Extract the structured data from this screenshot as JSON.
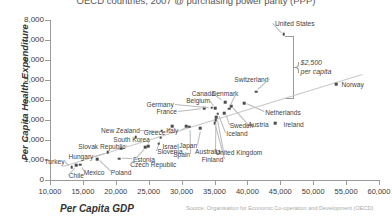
{
  "chart": {
    "title": "OECD countries, 2007 @ purchasing power parity (PPP)",
    "ylabel": "Per Capita Health Expenditure",
    "xlabel": "Per Capita GDP",
    "source": "Source: Organisation for Economic Co-operation and Development (OECD)",
    "annotation_line1": "$2,500",
    "annotation_line2": "per capita"
  },
  "chart_data": {
    "type": "scatter",
    "title": "OECD countries, 2007 @ purchasing power parity (PPP)",
    "xlabel": "Per Capita GDP",
    "ylabel": "Per Capita Health Expenditure",
    "xlim": [
      10000,
      60000
    ],
    "ylim": [
      0,
      8000
    ],
    "xticks": [
      "10,000",
      "15,000",
      "20,000",
      "25,000",
      "30,000",
      "35,000",
      "40,000",
      "45,000",
      "50,000",
      "55,000",
      "60,000"
    ],
    "yticks": [
      "0",
      "1,000",
      "2,000",
      "3,000",
      "4,000",
      "5,000",
      "6,000",
      "7,000",
      "8,000"
    ],
    "grid": false,
    "legend": null,
    "trendline": {
      "x0": 12000,
      "y0": 700,
      "x1": 57500,
      "y1": 5300
    },
    "annotations": [
      {
        "text": "$2,500 per capita",
        "x": 47500,
        "y": 5900,
        "note": "brace spanning United States point down to the trend line"
      }
    ],
    "points": [
      {
        "label": "Turkey",
        "x": 13300,
        "y": 640,
        "lx": 12200,
        "ly": 960,
        "anchor": "end"
      },
      {
        "label": "Chile",
        "x": 14000,
        "y": 740,
        "lx": 14000,
        "ly": 250,
        "anchor": "middle"
      },
      {
        "label": "Mexico",
        "x": 14600,
        "y": 760,
        "lx": 16700,
        "ly": 420,
        "anchor": "middle"
      },
      {
        "label": "Hungary",
        "x": 18800,
        "y": 1390,
        "lx": 16600,
        "ly": 1200,
        "anchor": "end"
      },
      {
        "label": "Poland",
        "x": 17200,
        "y": 1040,
        "lx": 20800,
        "ly": 400,
        "anchor": "middle"
      },
      {
        "label": "Estonia",
        "x": 20500,
        "y": 1070,
        "lx": 22600,
        "ly": 1060,
        "anchor": "start"
      },
      {
        "label": "Slovak Republic",
        "x": 20800,
        "y": 1570,
        "lx": 17900,
        "ly": 1720,
        "anchor": "middle"
      },
      {
        "label": "Czech Republic",
        "x": 24500,
        "y": 1640,
        "lx": 25700,
        "ly": 800,
        "anchor": "middle"
      },
      {
        "label": "South Korea",
        "x": 24900,
        "y": 1680,
        "lx": 22400,
        "ly": 2060,
        "anchor": "middle"
      },
      {
        "label": "Slovenia",
        "x": 26800,
        "y": 2110,
        "lx": 26300,
        "ly": 1470,
        "anchor": "start"
      },
      {
        "label": "Israel",
        "x": 26500,
        "y": 1820,
        "lx": 27100,
        "ly": 1700,
        "anchor": "start"
      },
      {
        "label": "New Zealand",
        "x": 27000,
        "y": 2470,
        "lx": 20700,
        "ly": 2520,
        "anchor": "middle"
      },
      {
        "label": "Greece",
        "x": 28600,
        "y": 2700,
        "lx": 25900,
        "ly": 2400,
        "anchor": "middle"
      },
      {
        "label": "Portugal",
        "x": 23000,
        "y": 2150,
        "lx": 23000,
        "ly": 2150,
        "anchor": "hidden"
      },
      {
        "label": "Spain",
        "x": 31200,
        "y": 2660,
        "lx": 30000,
        "ly": 1300,
        "anchor": "middle"
      },
      {
        "label": "Italy",
        "x": 30700,
        "y": 2680,
        "lx": 28600,
        "ly": 2490,
        "anchor": "middle"
      },
      {
        "label": "Japan",
        "x": 32800,
        "y": 2590,
        "lx": 31000,
        "ly": 1750,
        "anchor": "middle"
      },
      {
        "label": "Finland",
        "x": 35000,
        "y": 2840,
        "lx": 34700,
        "ly": 1030,
        "anchor": "middle"
      },
      {
        "label": "United Kingdom",
        "x": 35200,
        "y": 2990,
        "lx": 38700,
        "ly": 1400,
        "anchor": "middle"
      },
      {
        "label": "Australia",
        "x": 35300,
        "y": 3140,
        "lx": 34000,
        "ly": 1470,
        "anchor": "middle"
      },
      {
        "label": "Iceland",
        "x": 35500,
        "y": 3320,
        "lx": 36800,
        "ly": 2340,
        "anchor": "start"
      },
      {
        "label": "Sweden",
        "x": 36500,
        "y": 3350,
        "lx": 37300,
        "ly": 2730,
        "anchor": "start"
      },
      {
        "label": "France",
        "x": 33400,
        "y": 3600,
        "lx": 29300,
        "ly": 3440,
        "anchor": "end"
      },
      {
        "label": "Germany",
        "x": 34600,
        "y": 3620,
        "lx": 28800,
        "ly": 3800,
        "anchor": "end"
      },
      {
        "label": "Belgium",
        "x": 35100,
        "y": 3600,
        "lx": 32500,
        "ly": 4000,
        "anchor": "middle"
      },
      {
        "label": "Austria",
        "x": 37500,
        "y": 3700,
        "lx": 40100,
        "ly": 2820,
        "anchor": "start"
      },
      {
        "label": "Ireland",
        "x": 44200,
        "y": 2830,
        "lx": 45500,
        "ly": 2810,
        "anchor": "start"
      },
      {
        "label": "Netherlands",
        "x": 39500,
        "y": 3840,
        "lx": 42700,
        "ly": 3390,
        "anchor": "start"
      },
      {
        "label": "Canada",
        "x": 36600,
        "y": 3900,
        "lx": 33300,
        "ly": 4330,
        "anchor": "middle"
      },
      {
        "label": "Denmark",
        "x": 37200,
        "y": 3560,
        "lx": 36600,
        "ly": 4330,
        "anchor": "middle"
      },
      {
        "label": "Switzerland",
        "x": 41300,
        "y": 4420,
        "lx": 40600,
        "ly": 5050,
        "anchor": "middle"
      },
      {
        "label": "Norway",
        "x": 53500,
        "y": 4780,
        "lx": 54300,
        "ly": 4780,
        "anchor": "start"
      },
      {
        "label": "United States",
        "x": 45500,
        "y": 7290,
        "lx": 47200,
        "ly": 7860,
        "anchor": "middle"
      }
    ]
  }
}
